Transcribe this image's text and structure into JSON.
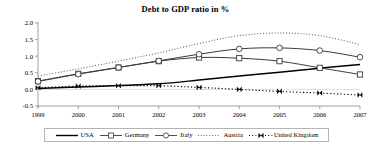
{
  "chart_data": {
    "type": "line",
    "title": "Debt to GDP ratio in %",
    "xlabel": "",
    "ylabel": "",
    "x": [
      1999,
      2000,
      2001,
      2002,
      2003,
      2004,
      2005,
      2006,
      2007
    ],
    "xticklabels": [
      "1999",
      "2000",
      "2001",
      "2002",
      "2003",
      "2004",
      "2005",
      "2006",
      "2007"
    ],
    "yticklabels": [
      "2.0",
      "1.5",
      "1.0",
      "0.5",
      "0.0",
      "-0.5"
    ],
    "yticks": [
      2.0,
      1.5,
      1.0,
      0.5,
      0.0,
      -0.5
    ],
    "ylim": [
      -0.5,
      2.0
    ],
    "xlim": [
      1999,
      2007
    ],
    "grid": false,
    "legend_position": "bottom",
    "series": [
      {
        "name": "USA",
        "style": "solid",
        "marker": "none",
        "color": "#000000",
        "values": [
          0.03,
          0.07,
          0.12,
          0.17,
          0.28,
          0.4,
          0.52,
          0.64,
          0.75
        ]
      },
      {
        "name": "Germany",
        "style": "solid",
        "marker": "square",
        "color": "#3a3a3a",
        "values": [
          0.25,
          0.47,
          0.66,
          0.85,
          0.96,
          0.94,
          0.85,
          0.65,
          0.45
        ]
      },
      {
        "name": "Italy",
        "style": "solid",
        "marker": "circle",
        "color": "#3a3a3a",
        "values": [
          0.24,
          0.46,
          0.66,
          0.86,
          1.06,
          1.22,
          1.25,
          1.17,
          0.97
        ]
      },
      {
        "name": "Austria",
        "style": "dotted",
        "marker": "none",
        "color": "#555555",
        "values": [
          0.4,
          0.62,
          0.85,
          1.1,
          1.38,
          1.62,
          1.7,
          1.62,
          1.35
        ]
      },
      {
        "name": "United Kingdom",
        "style": "dash-dot",
        "marker": "bowtie",
        "color": "#000000",
        "values": [
          0.05,
          0.1,
          0.11,
          0.11,
          0.06,
          0.0,
          -0.06,
          -0.11,
          -0.17
        ]
      }
    ]
  },
  "legend": {
    "items": [
      {
        "label": "USA",
        "icon": "solid-line-swatch"
      },
      {
        "label": "Germany",
        "icon": "square-marker-line-swatch"
      },
      {
        "label": "Italy",
        "icon": "circle-marker-line-swatch"
      },
      {
        "label": "Austria",
        "icon": "dotted-line-swatch"
      },
      {
        "label": "United Kingdom",
        "icon": "dash-dot-bowtie-swatch"
      }
    ]
  }
}
